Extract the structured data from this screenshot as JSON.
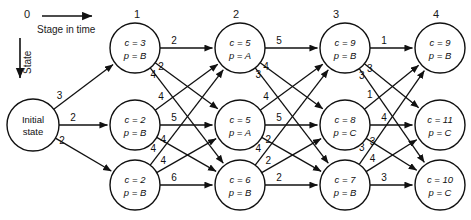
{
  "figure": {
    "axis": {
      "stage_axis_label": "Stage in time",
      "state_axis_label": "State"
    },
    "stage_numbers": [
      "0",
      "1",
      "2",
      "3",
      "4"
    ],
    "initial_node": {
      "line1": "Initial",
      "line2": "state"
    },
    "nodes": [
      {
        "id": "s1n1",
        "stage": 1,
        "row": 0,
        "cost_label": "c = 3",
        "pred_label": "p = B",
        "cost": 3,
        "pred": "B"
      },
      {
        "id": "s1n2",
        "stage": 1,
        "row": 1,
        "cost_label": "c = 2",
        "pred_label": "p = B",
        "cost": 2,
        "pred": "B"
      },
      {
        "id": "s1n3",
        "stage": 1,
        "row": 2,
        "cost_label": "c = 2",
        "pred_label": "p = B",
        "cost": 2,
        "pred": "B"
      },
      {
        "id": "s2n1",
        "stage": 2,
        "row": 0,
        "cost_label": "c = 5",
        "pred_label": "p = A",
        "cost": 5,
        "pred": "A"
      },
      {
        "id": "s2n2",
        "stage": 2,
        "row": 1,
        "cost_label": "c = 5",
        "pred_label": "p = A",
        "cost": 5,
        "pred": "A"
      },
      {
        "id": "s2n3",
        "stage": 2,
        "row": 2,
        "cost_label": "c = 6",
        "pred_label": "p = B",
        "cost": 6,
        "pred": "B"
      },
      {
        "id": "s3n1",
        "stage": 3,
        "row": 0,
        "cost_label": "c = 9",
        "pred_label": "p = B",
        "cost": 9,
        "pred": "B"
      },
      {
        "id": "s3n2",
        "stage": 3,
        "row": 1,
        "cost_label": "c = 8",
        "pred_label": "p = C",
        "cost": 8,
        "pred": "C"
      },
      {
        "id": "s3n3",
        "stage": 3,
        "row": 2,
        "cost_label": "c = 7",
        "pred_label": "p = B",
        "cost": 7,
        "pred": "B"
      },
      {
        "id": "s4n1",
        "stage": 4,
        "row": 0,
        "cost_label": "c = 9",
        "pred_label": "p = B",
        "cost": 9,
        "pred": "B"
      },
      {
        "id": "s4n2",
        "stage": 4,
        "row": 1,
        "cost_label": "c = 11",
        "pred_label": "p = C",
        "cost": 11,
        "pred": "C"
      },
      {
        "id": "s4n3",
        "stage": 4,
        "row": 2,
        "cost_label": "c = 10",
        "pred_label": "p = C",
        "cost": 10,
        "pred": "C"
      }
    ],
    "edges": [
      {
        "from": "init",
        "to": "s1n1",
        "weight": "3"
      },
      {
        "from": "init",
        "to": "s1n2",
        "weight": "2"
      },
      {
        "from": "init",
        "to": "s1n3",
        "weight": "2"
      },
      {
        "from": "s1n1",
        "to": "s2n1",
        "weight": "2"
      },
      {
        "from": "s1n1",
        "to": "s2n2",
        "weight": "2"
      },
      {
        "from": "s1n1",
        "to": "s2n3",
        "weight": "4"
      },
      {
        "from": "s1n2",
        "to": "s2n1",
        "weight": "4"
      },
      {
        "from": "s1n2",
        "to": "s2n2",
        "weight": "5"
      },
      {
        "from": "s1n2",
        "to": "s2n3",
        "weight": "4"
      },
      {
        "from": "s1n3",
        "to": "s2n1",
        "weight": "4"
      },
      {
        "from": "s1n3",
        "to": "s2n2",
        "weight": "4"
      },
      {
        "from": "s1n3",
        "to": "s2n3",
        "weight": "6"
      },
      {
        "from": "s2n1",
        "to": "s3n1",
        "weight": "5"
      },
      {
        "from": "s2n1",
        "to": "s3n2",
        "weight": "4"
      },
      {
        "from": "s2n1",
        "to": "s3n3",
        "weight": "3"
      },
      {
        "from": "s2n2",
        "to": "s3n1",
        "weight": "4"
      },
      {
        "from": "s2n2",
        "to": "s3n2",
        "weight": "5"
      },
      {
        "from": "s2n2",
        "to": "s3n3",
        "weight": "2"
      },
      {
        "from": "s2n3",
        "to": "s3n1",
        "weight": "4"
      },
      {
        "from": "s2n3",
        "to": "s3n2",
        "weight": "2"
      },
      {
        "from": "s2n3",
        "to": "s3n3",
        "weight": "2"
      },
      {
        "from": "s3n1",
        "to": "s4n1",
        "weight": "1"
      },
      {
        "from": "s3n1",
        "to": "s4n2",
        "weight": "3"
      },
      {
        "from": "s3n1",
        "to": "s4n3",
        "weight": "3"
      },
      {
        "from": "s3n2",
        "to": "s4n1",
        "weight": "1"
      },
      {
        "from": "s3n2",
        "to": "s4n2",
        "weight": "4"
      },
      {
        "from": "s3n2",
        "to": "s4n3",
        "weight": "3"
      },
      {
        "from": "s3n3",
        "to": "s4n1",
        "weight": "3"
      },
      {
        "from": "s3n3",
        "to": "s4n2",
        "weight": "4"
      },
      {
        "from": "s3n3",
        "to": "s4n3",
        "weight": "3"
      }
    ]
  }
}
